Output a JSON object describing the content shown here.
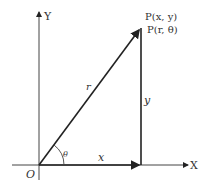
{
  "diagram": {
    "axes": {
      "x_label": "X",
      "y_label": "Y",
      "origin_label": "O"
    },
    "point": {
      "cartesian_label": "P(x, y)",
      "polar_label": "P(r, θ)"
    },
    "segments": {
      "radius_label": "r",
      "x_label": "x",
      "y_label": "y"
    },
    "angle_label": "θ",
    "colors": {
      "line": "#222222",
      "text": "#333333",
      "background": "#ffffff"
    }
  }
}
